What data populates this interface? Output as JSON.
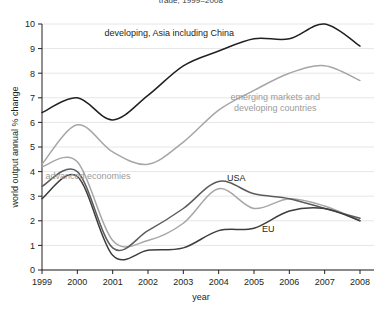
{
  "chart_data": {
    "type": "line",
    "title": "trade, 1999–2008",
    "xlabel": "year",
    "ylabel": "world output annual % change",
    "xlim": [
      1999,
      2008
    ],
    "ylim": [
      0,
      10
    ],
    "grid": true,
    "legend_position": "inline-annotations",
    "x": [
      1999,
      2000,
      2001,
      2002,
      2003,
      2004,
      2005,
      2006,
      2007,
      2008
    ],
    "yticks": [
      "0",
      "1",
      "2",
      "3",
      "4",
      "5",
      "6",
      "7",
      "8",
      "9",
      "10"
    ],
    "xticks": [
      "1999",
      "2000",
      "2001",
      "2002",
      "2003",
      "2004",
      "2005",
      "2006",
      "2007",
      "2008"
    ],
    "series": [
      {
        "name": "developing, Asia including China",
        "color": "#231f20",
        "label_x": 2002.6,
        "label_y": 9.5,
        "values": [
          6.4,
          7.0,
          6.1,
          7.1,
          8.3,
          8.9,
          9.4,
          9.4,
          10.0,
          9.1
        ]
      },
      {
        "name": "emerging markets and developing countries",
        "color": "#a6a6a6",
        "label_x": 2005.6,
        "label_y": 6.9,
        "values": [
          4.3,
          5.9,
          4.8,
          4.3,
          5.2,
          6.5,
          7.3,
          8.0,
          8.3,
          7.7
        ]
      },
      {
        "name": "advanced economies",
        "color": "#a6a6a6",
        "label_x": 2000.3,
        "label_y": 3.7,
        "values": [
          4.2,
          4.4,
          1.2,
          1.2,
          1.9,
          3.3,
          2.5,
          2.9,
          2.6,
          2.0
        ]
      },
      {
        "name": "USA",
        "color": "#5b5b5b",
        "label_x": 2004.5,
        "label_y": 3.6,
        "values": [
          3.4,
          4.0,
          0.9,
          1.6,
          2.5,
          3.6,
          3.1,
          2.9,
          2.5,
          2.1
        ]
      },
      {
        "name": "EU",
        "color": "#3d3d3d",
        "label_x": 2005.4,
        "label_y": 1.55,
        "values": [
          2.9,
          3.8,
          0.6,
          0.8,
          0.9,
          1.6,
          1.7,
          2.4,
          2.5,
          2.0
        ]
      }
    ]
  }
}
